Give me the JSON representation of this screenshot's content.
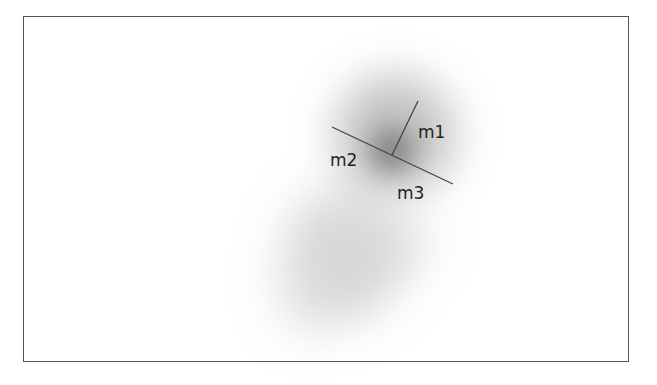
{
  "diagram": {
    "labels": {
      "m1": "m1",
      "m2": "m2",
      "m3": "m3"
    },
    "colors": {
      "line": "#444444",
      "blob": "#666666",
      "border": "#555555"
    }
  }
}
